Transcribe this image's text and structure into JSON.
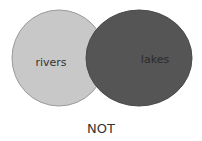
{
  "diagram": {
    "type": "venn",
    "sets": [
      {
        "label": "rivers",
        "fill": "#c8c8c8",
        "stroke": "#9a9a9a"
      },
      {
        "label": "lakes",
        "fill": "#555555",
        "stroke": "#4a4a4a"
      }
    ],
    "caption": "NOT"
  }
}
